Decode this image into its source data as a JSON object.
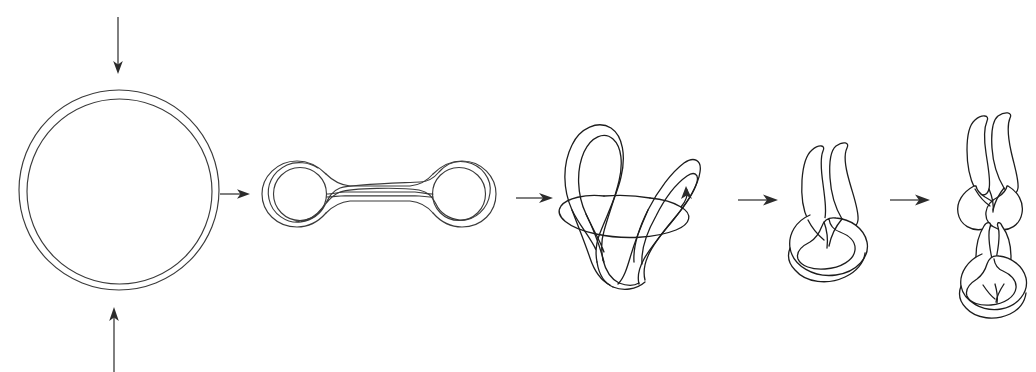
{
  "figure": {
    "background_color": "#ffffff",
    "line_color": "#3a3a3a",
    "dark_line_color": "#1d1d1d",
    "arrow_color": "#2b2b2b",
    "width": 1036,
    "height": 372,
    "caption": "",
    "labels": []
  },
  "stages": [
    {
      "id": "stage-1-relaxed-circle",
      "name": "relaxed-circular-duplex",
      "label": "",
      "center_x": 119,
      "center_y": 190,
      "outer_radius": 100,
      "inner_radius": 93,
      "description": "Relaxed closed circular double-stranded ring drawn as two concentric circles"
    },
    {
      "id": "stage-2-dumbbell",
      "name": "collapsed-dumbbell",
      "label": "",
      "left_ring_center_x": 301,
      "left_ring_center_y": 194,
      "right_ring_center_x": 458,
      "right_ring_center_y": 194,
      "ring_outer_radius": 33,
      "ring_inner_radius": 26,
      "connector_left_x": 325,
      "connector_right_x": 436,
      "description": "Ring pinched in the middle forming two lobes joined by a narrow double-stranded tube"
    },
    {
      "id": "stage-3-folding-loops",
      "name": "folding-twisted-loops",
      "label": "",
      "bounds": {
        "x": 552,
        "y": 115,
        "width": 150,
        "height": 150
      },
      "description": "Dumbbell folded so two lobes rise as loops while the connector twists; curved rotation arrow at the base"
    },
    {
      "id": "stage-4-single-supercoil",
      "name": "single-node-supercoil",
      "label": "",
      "bounds": {
        "x": 795,
        "y": 135,
        "width": 78,
        "height": 120
      },
      "description": "One interwound supercoil node: two parallel tubes crossing into a basal loop"
    },
    {
      "id": "stage-5-double-supercoil",
      "name": "double-node-supercoil",
      "label": "",
      "bounds": {
        "x": 955,
        "y": 100,
        "width": 70,
        "height": 190
      },
      "description": "Two stacked interwound supercoil nodes forming an extended plectoneme"
    }
  ],
  "arrows": [
    {
      "id": "arrow-top-compress",
      "name": "compression-arrow-top",
      "direction": "down",
      "x": 118,
      "y_start": 17,
      "y_end": 73,
      "label": ""
    },
    {
      "id": "arrow-bottom-compress",
      "name": "compression-arrow-bottom",
      "direction": "up",
      "x": 114,
      "y_start": 372,
      "y_end": 307,
      "label": ""
    },
    {
      "id": "arrow-step-1-2",
      "name": "transition-arrow-1",
      "direction": "right",
      "x_start": 220,
      "x_end": 249,
      "y": 194,
      "label": ""
    },
    {
      "id": "arrow-step-2-3",
      "name": "transition-arrow-2",
      "direction": "right",
      "x_start": 516,
      "x_end": 552,
      "y": 198,
      "label": ""
    },
    {
      "id": "arrow-step-3-4",
      "name": "transition-arrow-3",
      "direction": "right",
      "x_start": 738,
      "x_end": 777,
      "y": 200,
      "label": ""
    },
    {
      "id": "arrow-step-4-5",
      "name": "transition-arrow-4",
      "direction": "right",
      "x_start": 890,
      "x_end": 930,
      "y": 200,
      "label": ""
    },
    {
      "id": "arrow-rotation",
      "name": "rotation-arrow",
      "direction": "curved-right",
      "x": 686,
      "y": 196,
      "label": ""
    }
  ]
}
